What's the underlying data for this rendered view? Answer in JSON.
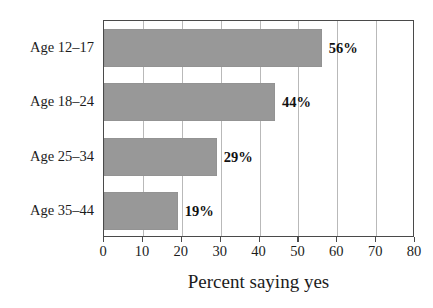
{
  "chart_data": {
    "type": "bar",
    "orientation": "horizontal",
    "title": "",
    "xlabel": "Percent saying yes",
    "ylabel": "",
    "categories": [
      "Age 12–17",
      "Age 18–24",
      "Age 25–34",
      "Age 35–44"
    ],
    "values": [
      56,
      44,
      29,
      19
    ],
    "value_labels": [
      "56%",
      "44%",
      "29%",
      "19%"
    ],
    "xlim": [
      0,
      80
    ],
    "xticks": [
      0,
      10,
      20,
      30,
      40,
      50,
      60,
      70,
      80
    ],
    "xtick_labels": [
      "0",
      "10",
      "20",
      "30",
      "40",
      "50",
      "60",
      "70",
      "80"
    ],
    "grid": "vertical",
    "legend": "none",
    "bar_color": "#989898",
    "grid_color": "#b9b9b9",
    "frame_color": "#4a4a4a",
    "background_color": "#ffffff",
    "text_color": "#1c1c1c"
  }
}
